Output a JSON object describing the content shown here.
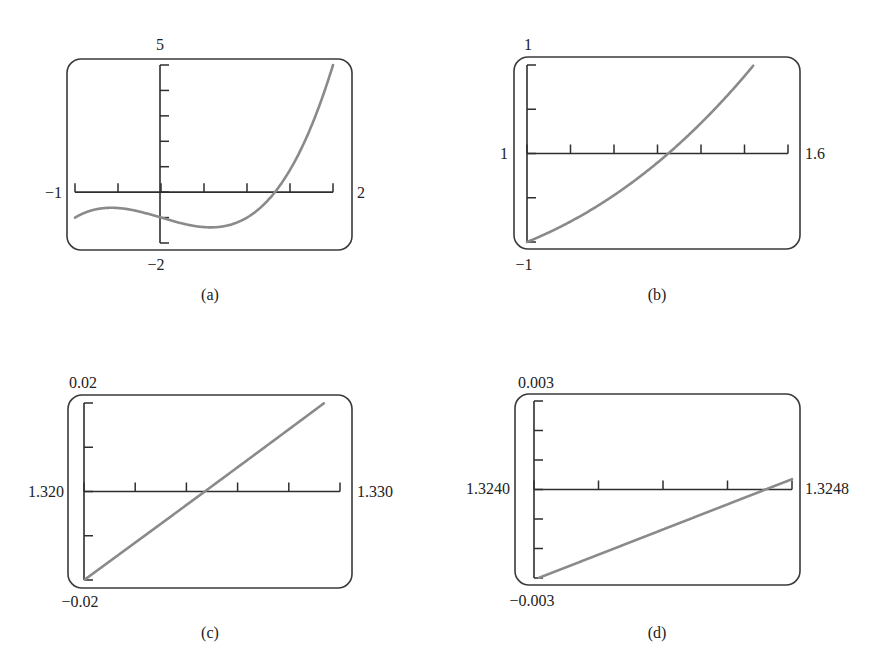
{
  "figure": {
    "colors": {
      "curve": "#8a8a8a",
      "axes": "#2e2e2e",
      "frame": "#3a3a3a",
      "text": "#222222"
    }
  },
  "chart_data": [
    {
      "type": "line",
      "id": "a",
      "caption": "(a)",
      "function": "x^3 - x - 1",
      "xlim": [
        -1,
        2
      ],
      "ylim": [
        -2,
        5
      ],
      "xtick_step": 0.5,
      "ytick_step": 1,
      "labels": {
        "xmin": "−1",
        "xmax": "2",
        "ymin": "−2",
        "ymax": "5"
      },
      "grid": false,
      "points": [
        [
          -1,
          -1
        ],
        [
          -0.577,
          -0.615
        ],
        [
          0,
          -1
        ],
        [
          0.577,
          -1.385
        ],
        [
          1,
          -1
        ],
        [
          1.3247,
          0
        ],
        [
          1.5,
          0.875
        ],
        [
          2,
          5
        ]
      ]
    },
    {
      "type": "line",
      "id": "b",
      "caption": "(b)",
      "function": "x^3 - x - 1",
      "xlim": [
        1,
        1.6
      ],
      "ylim": [
        -1,
        1
      ],
      "xtick_step": 0.1,
      "ytick_step": 0.5,
      "labels": {
        "xmin": "1",
        "xmax": "1.6",
        "ymin": "−1",
        "ymax": "1"
      },
      "grid": false,
      "points": [
        [
          1,
          -1
        ],
        [
          1.1,
          -0.769
        ],
        [
          1.2,
          -0.472
        ],
        [
          1.3,
          -0.103
        ],
        [
          1.3247,
          0
        ],
        [
          1.4,
          0.344
        ],
        [
          1.5,
          0.875
        ],
        [
          1.52,
          0.992
        ]
      ]
    },
    {
      "type": "line",
      "id": "c",
      "caption": "(c)",
      "function": "x^3 - x - 1",
      "xlim": [
        1.32,
        1.33
      ],
      "ylim": [
        -0.02,
        0.02
      ],
      "xtick_step": 0.002,
      "ytick_step": 0.01,
      "labels": {
        "xmin": "1.320",
        "xmax": "1.330",
        "ymin": "−0.02",
        "ymax": "0.02"
      },
      "grid": false,
      "points": [
        [
          1.32,
          -0.020032
        ],
        [
          1.3247,
          0
        ],
        [
          1.329,
          0.01826
        ],
        [
          1.3293,
          0.0197
        ]
      ]
    },
    {
      "type": "line",
      "id": "d",
      "caption": "(d)",
      "function": "x^3 - x - 1",
      "xlim": [
        1.324,
        1.3248
      ],
      "ylim": [
        -0.003,
        0.003
      ],
      "xtick_step": 0.0002,
      "ytick_step": 0.001,
      "labels": {
        "xmin": "1.3240",
        "xmax": "1.3248",
        "ymin": "−0.003",
        "ymax": "0.003"
      },
      "grid": false,
      "points": [
        [
          1.324,
          -0.00303
        ],
        [
          1.3247,
          0
        ],
        [
          1.3248,
          0.00034
        ]
      ]
    }
  ]
}
